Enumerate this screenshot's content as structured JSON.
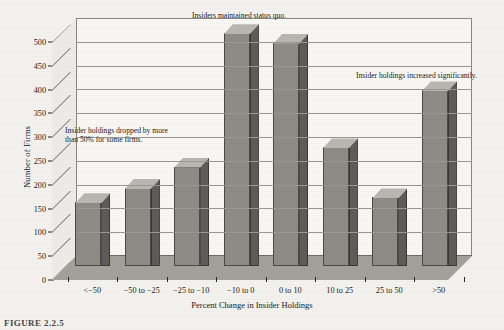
{
  "chart_data": {
    "type": "bar",
    "title": "",
    "xlabel": "Percent Change in Insider Holdings",
    "ylabel": "Number of Firms",
    "categories": [
      "<−50",
      "−50 to −25",
      "−25 to −10",
      "−10 to 0",
      "0 to 10",
      "10 to 25",
      "25 to 50",
      ">50"
    ],
    "values": [
      135,
      165,
      210,
      490,
      470,
      250,
      145,
      370
    ],
    "ylim": [
      0,
      500
    ],
    "ytick_labels": [
      "0",
      "50",
      "100",
      "150",
      "200",
      "250",
      "300",
      "350",
      "400",
      "450",
      "500"
    ],
    "ytick_values": [
      0,
      50,
      100,
      150,
      200,
      250,
      300,
      350,
      400,
      450,
      500
    ],
    "grid": true,
    "legend": "none",
    "annotations": [
      {
        "id": "left",
        "text": "Insider holdings dropped by more\nthan 50% for some firms."
      },
      {
        "id": "middle",
        "text": "Insiders maintained status quo."
      },
      {
        "id": "right",
        "text": "Insider holdings increased significantly."
      }
    ],
    "colors": {
      "bar_front": "#8e8b86",
      "bar_side": "#5e5c58",
      "bar_top": "#b9b6b1",
      "plot_background": "#f7f6f3",
      "floor": "#a3a09a",
      "page_background": "#f2f1ee",
      "gridline": "#9a9792",
      "text": "#1d1b19"
    }
  },
  "caption": {
    "label": "FIGURE 2.2.5"
  }
}
